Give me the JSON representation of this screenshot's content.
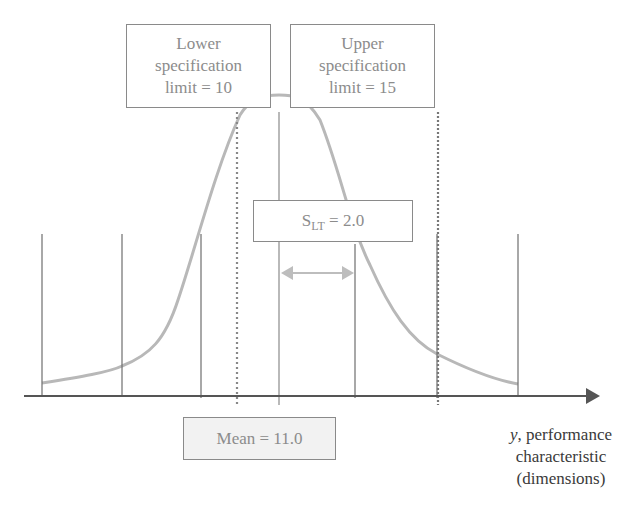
{
  "lower_spec": {
    "line1": "Lower",
    "line2": "specification",
    "line3": "limit = 10"
  },
  "upper_spec": {
    "line1": "Upper",
    "line2": "specification",
    "line3": "limit = 15"
  },
  "std_dev": {
    "symbol": "S",
    "subscript": "LT",
    "value": " = 2.0"
  },
  "mean": {
    "label": "Mean = 11.0"
  },
  "axis_label": {
    "line1_italic": "y",
    "line1_rest": ", performance",
    "line2": "characteristic",
    "line3": "(dimensions)"
  },
  "colors": {
    "curve": "#b8b8b8",
    "lines": "#6e6e6e",
    "axis": "#555555",
    "arrow": "#bdbdbd",
    "box_border": "#8a8a8a",
    "text": "#8c8c8c"
  }
}
